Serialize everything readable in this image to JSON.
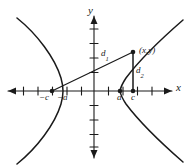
{
  "figure": {
    "type": "math-diagram",
    "width": 187,
    "height": 165,
    "stroke_color": "#1a1a1a",
    "background_color": "#ffffff"
  },
  "axes": {
    "x_label": "x",
    "y_label": "y",
    "x_axis_y_px": 91,
    "y_axis_x_px": 94,
    "tick_spacing_px": 14.5,
    "x_ticks_count": 12,
    "y_ticks_count": 8,
    "arrows": [
      "left",
      "right",
      "up",
      "down"
    ]
  },
  "tick_labels": {
    "neg_c": "−c",
    "neg_a": "−a",
    "a": "a",
    "c": "c"
  },
  "points": {
    "focus_left": {
      "label": "−c",
      "x_px": 52,
      "y_px": 91
    },
    "vertex_left": {
      "label": "−a",
      "x_px": 63,
      "y_px": 91
    },
    "vertex_right": {
      "label": "a",
      "x_px": 120,
      "y_px": 91
    },
    "focus_right": {
      "label": "c",
      "x_px": 133,
      "y_px": 91
    },
    "point_on_curve": {
      "label": "(x,y)",
      "x_px": 133,
      "y_px": 52
    }
  },
  "segments": {
    "d1": {
      "label": "d",
      "subscript": "1",
      "from": "focus_left",
      "to": "point_on_curve"
    },
    "d2": {
      "label": "d",
      "subscript": "2",
      "from": "focus_right",
      "to": "point_on_curve"
    }
  },
  "curves": {
    "branch_right": "opens right, vertex at a",
    "branch_left": "opens left, vertex at −a"
  }
}
